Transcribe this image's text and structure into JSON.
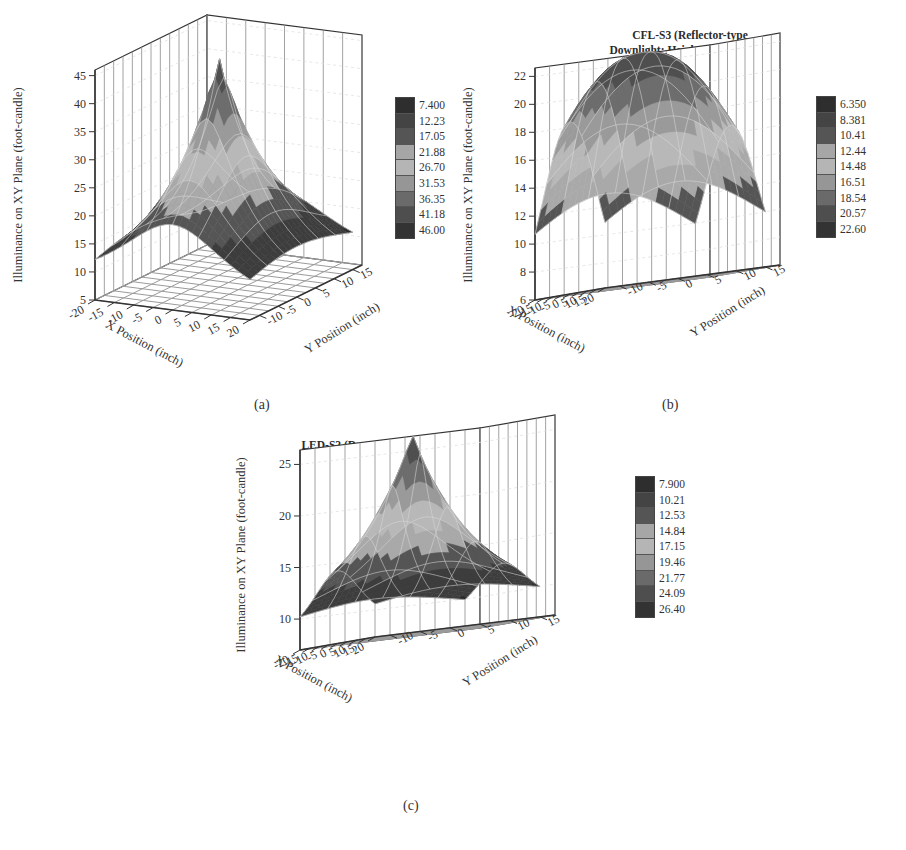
{
  "figure": {
    "panels": [
      {
        "id": "a",
        "caption": "(a)",
        "title": "INC-S4 (Reflector-type\nDownlight: Height = 30.5 inches)",
        "zlabel": "Illuminance on XY Plane (foot-candle)",
        "xlabel": "X Position (inch)",
        "ylabel": "Y Position (inch)",
        "legend": [
          "7.400",
          "12.23",
          "17.05",
          "21.88",
          "26.70",
          "31.53",
          "36.35",
          "41.18",
          "46.00"
        ]
      },
      {
        "id": "b",
        "caption": "(b)",
        "title": "CFL-S3 (Reflector-type\nDownlight: Height = 30.5 inches)",
        "zlabel": "Illuminance on XY Plane (foot-candle)",
        "xlabel": "X Position (inch)",
        "ylabel": "Y Position (inch)",
        "legend": [
          "6.350",
          "8.381",
          "10.41",
          "12.44",
          "14.48",
          "16.51",
          "18.54",
          "20.57",
          "22.60"
        ]
      },
      {
        "id": "c",
        "caption": "(c)",
        "title": "LED-S2 (Downlight: Height = 30.5 inches)",
        "zlabel": "Illuminance on XY Plane (foot-candle)",
        "xlabel": "X Position (inch)",
        "ylabel": "Y Position (inch)",
        "legend": [
          "7.900",
          "10.21",
          "12.53",
          "14.84",
          "17.15",
          "19.46",
          "21.77",
          "24.09",
          "26.40"
        ]
      }
    ]
  },
  "chart_data": [
    {
      "type": "surface3d",
      "title": "INC-S4 (Reflector-type Downlight: Height = 30.5 inches)",
      "xlabel": "X Position (inch)",
      "ylabel": "Y Position (inch)",
      "zlabel": "Illuminance on XY Plane (foot-candle)",
      "x_ticks": [
        -20,
        -15,
        -10,
        -5,
        0,
        5,
        10,
        15,
        20
      ],
      "y_ticks": [
        -10,
        -5,
        0,
        5,
        10,
        15
      ],
      "z_ticks": [
        5,
        10,
        15,
        20,
        25,
        30,
        35,
        40,
        45
      ],
      "zlim": [
        5,
        46
      ],
      "peak": {
        "x": 0,
        "y": 0,
        "z": 46.0
      },
      "min_value": 7.4,
      "colorbar_levels": [
        7.4,
        12.23,
        17.05,
        21.88,
        26.7,
        31.53,
        36.35,
        41.18,
        46.0
      ],
      "grid": true
    },
    {
      "type": "surface3d",
      "title": "CFL-S3 (Reflector-type Downlight: Height = 30.5 inches)",
      "xlabel": "X Position (inch)",
      "ylabel": "Y Position (inch)",
      "zlabel": "Illuminance on XY Plane (foot-candle)",
      "x_ticks": [
        -20,
        -15,
        -10,
        -5,
        0,
        5,
        10,
        15,
        20
      ],
      "y_ticks": [
        -10,
        -5,
        0,
        5,
        10,
        15
      ],
      "z_ticks": [
        6,
        8,
        10,
        12,
        14,
        16,
        18,
        20,
        22
      ],
      "zlim": [
        6,
        22.6
      ],
      "peak": {
        "x": 0,
        "y": 0,
        "z": 22.6
      },
      "min_value": 6.35,
      "colorbar_levels": [
        6.35,
        8.381,
        10.41,
        12.44,
        14.48,
        16.51,
        18.54,
        20.57,
        22.6
      ],
      "grid": true
    },
    {
      "type": "surface3d",
      "title": "LED-S2 (Downlight: Height = 30.5 inches)",
      "xlabel": "X Position (inch)",
      "ylabel": "Y Position (inch)",
      "zlabel": "Illuminance on XY Plane (foot-candle)",
      "x_ticks": [
        -20,
        -15,
        -10,
        -5,
        0,
        5,
        10,
        15,
        20
      ],
      "y_ticks": [
        -10,
        -5,
        0,
        5,
        10,
        15
      ],
      "z_ticks": [
        10,
        15,
        20,
        25
      ],
      "zlim": [
        7.9,
        26.4
      ],
      "peak": {
        "x": 0,
        "y": 0,
        "z": 26.4
      },
      "min_value": 7.9,
      "colorbar_levels": [
        7.9,
        10.21,
        12.53,
        14.84,
        17.15,
        19.46,
        21.77,
        24.09,
        26.4
      ],
      "grid": true
    }
  ],
  "render": {
    "band_colors": [
      "#2b2b2b",
      "#3d3d3d",
      "#555555",
      "#a9a9a9",
      "#b8b8b8",
      "#9a9a9a",
      "#6d6d6d",
      "#4f4f4f",
      "#333333"
    ],
    "legend_colors": [
      "#2e2e2e",
      "#444444",
      "#555555",
      "#a6a6a6",
      "#b5b5b5",
      "#969696",
      "#6a6a6a",
      "#4e4e4e",
      "#333333"
    ],
    "surface_line": "#d8d8d8",
    "axis_color": "#333333",
    "grid_color": "#9a9a9a"
  }
}
